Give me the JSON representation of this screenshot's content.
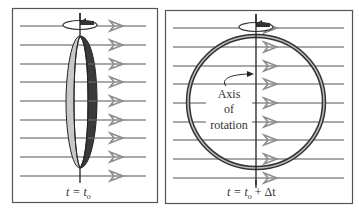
{
  "figure": {
    "colors": {
      "field_line": "#8c8c8c",
      "panel_border": "#555555",
      "ring_light": "#c8c8c8",
      "ring_dark": "#3a3a3a",
      "axis": "#222222"
    },
    "panels": [
      {
        "id": "left",
        "caption": "t = t",
        "caption_sub": "o",
        "field_line_count": 9,
        "loop_orientation": "edge-on"
      },
      {
        "id": "right",
        "caption": "t = t",
        "caption_sub": "o",
        "caption_suffix": " + Δt",
        "field_line_count": 9,
        "loop_orientation": "face-on",
        "annotation": {
          "line1": "Axis",
          "line2": "of",
          "line3": "rotation"
        }
      }
    ]
  }
}
